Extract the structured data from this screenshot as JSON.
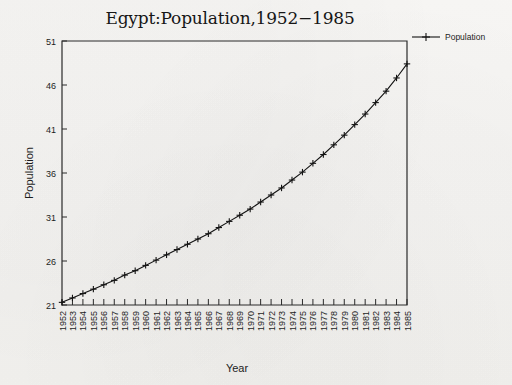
{
  "chart_data": {
    "type": "line",
    "title": "Egypt:Population,1952−1985",
    "xlabel": "Year",
    "ylabel": "Population",
    "legend": [
      "Population"
    ],
    "legend_position": "top-right-outside",
    "grid": false,
    "marker": "plus",
    "xlim": [
      1952,
      1985
    ],
    "ylim": [
      21,
      51
    ],
    "yticks": [
      21,
      26,
      31,
      36,
      41,
      46,
      51
    ],
    "categories": [
      "1952",
      "1953",
      "1954",
      "1955",
      "1956",
      "1957",
      "1958",
      "1959",
      "1960",
      "1961",
      "1962",
      "1963",
      "1964",
      "1965",
      "1966",
      "1967",
      "1968",
      "1969",
      "1970",
      "1971",
      "1972",
      "1973",
      "1974",
      "1975",
      "1976",
      "1977",
      "1978",
      "1979",
      "1980",
      "1981",
      "1982",
      "1983",
      "1984",
      "1985"
    ],
    "series": [
      {
        "name": "Population",
        "values": [
          21.3,
          21.8,
          22.3,
          22.8,
          23.3,
          23.8,
          24.4,
          24.9,
          25.5,
          26.1,
          26.7,
          27.3,
          27.9,
          28.5,
          29.1,
          29.8,
          30.5,
          31.2,
          31.9,
          32.7,
          33.5,
          34.3,
          35.2,
          36.1,
          37.1,
          38.1,
          39.2,
          40.3,
          41.5,
          42.7,
          44.0,
          45.3,
          46.8,
          48.4
        ]
      }
    ]
  },
  "axes": {
    "x_tick_labels": [
      "1952",
      "1953",
      "1954",
      "1955",
      "1956",
      "1957",
      "1958",
      "1959",
      "1960",
      "1961",
      "1962",
      "1963",
      "1964",
      "1965",
      "1966",
      "1967",
      "1968",
      "1969",
      "1970",
      "1971",
      "1972",
      "1973",
      "1974",
      "1975",
      "1976",
      "1977",
      "1978",
      "1979",
      "1980",
      "1981",
      "1982",
      "1983",
      "1984",
      "1985"
    ],
    "y_tick_labels": [
      "21",
      "26",
      "31",
      "36",
      "41",
      "46",
      "51"
    ]
  },
  "legend": {
    "entries": [
      {
        "label": "Population",
        "marker": "plus",
        "color": "#131313"
      }
    ]
  },
  "style": {
    "background": "#f6f5f3",
    "ink": "#131313",
    "axis": "#2a2a2a"
  }
}
